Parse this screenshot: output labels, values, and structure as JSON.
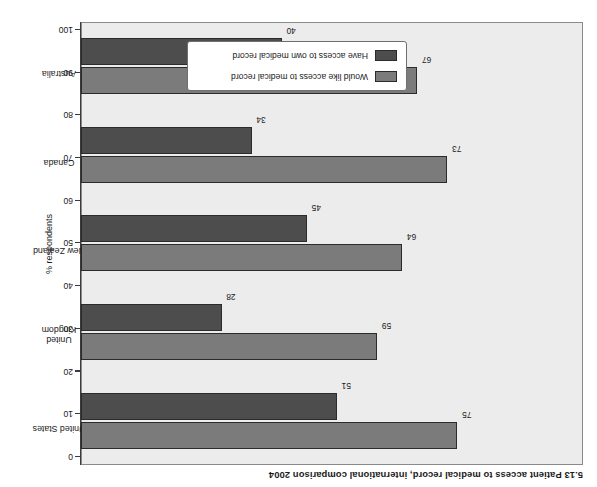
{
  "chart_data": {
    "type": "bar",
    "orientation": "horizontal",
    "title": "5.13  Patient access to medical record, international comparison 2004",
    "xlabel": "",
    "ylabel": "% respondents",
    "categories": [
      "United States",
      "United Kingdom",
      "New Zealand",
      "Canada",
      "Australia"
    ],
    "category_labels_wrapped": [
      "United States",
      "United\nKingdom",
      "New Zealand",
      "Canada",
      "Australia"
    ],
    "series": [
      {
        "name": "Have access to own medical record",
        "color": "#4d4d4d",
        "values": [
          51,
          28,
          45,
          34,
          40
        ]
      },
      {
        "name": "Would like access to medical record",
        "color": "#7b7b7b",
        "values": [
          75,
          59,
          64,
          73,
          67
        ]
      }
    ],
    "value_axis": {
      "min": 0,
      "max": 100,
      "ticks": [
        0,
        10,
        20,
        30,
        40,
        50,
        60,
        70,
        80,
        90,
        100
      ],
      "tick_labels": [
        "0",
        "10",
        "20",
        "30",
        "40",
        "50",
        "60",
        "70",
        "80",
        "90",
        "100"
      ]
    },
    "grid": false,
    "legend_position": "inside-bottom-right",
    "plot_background": "#ececec",
    "page_background": "#ffffff",
    "rotated_180": true
  },
  "legend": {
    "entries": [
      {
        "label": "Would like access to medical record",
        "color": "#7b7b7b"
      },
      {
        "label": "Have access to own medical record",
        "color": "#4d4d4d"
      }
    ]
  }
}
